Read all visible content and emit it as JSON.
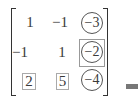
{
  "matrix": {
    "rows": [
      [
        "1",
        "−1",
        "−3"
      ],
      [
        "−1",
        "1",
        "−2"
      ],
      [
        "2",
        "5",
        "−4"
      ]
    ],
    "circled_column": 3,
    "boxed_entries": [
      "2",
      "5"
    ],
    "squared_circle_entry": "−2"
  },
  "colors": {
    "text": "#3a3a3a",
    "box": "#aaaaaa",
    "bar": "#777777"
  }
}
